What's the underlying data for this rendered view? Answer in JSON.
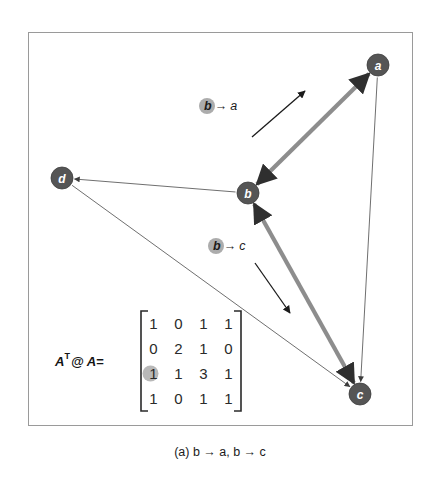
{
  "figure": {
    "caption": "(a) b → a, b → c",
    "frame_color": "#9a9a9a",
    "background": "#ffffff"
  },
  "graph": {
    "node_fill": "#555555",
    "node_text_color": "#ffffff",
    "thin_edge_color": "#5f5f5f",
    "thick_edge_color": "#8d8d8d",
    "nodes": [
      {
        "id": "a",
        "label": "a",
        "x": 378,
        "y": 65,
        "r": 11
      },
      {
        "id": "b",
        "label": "b",
        "x": 248,
        "y": 193,
        "r": 11
      },
      {
        "id": "c",
        "label": "c",
        "x": 360,
        "y": 394,
        "r": 11
      },
      {
        "id": "d",
        "label": "d",
        "x": 62,
        "y": 178,
        "r": 11
      }
    ],
    "edges": [
      {
        "from": "b",
        "to": "a",
        "style": "thick",
        "arrows": "both",
        "name": "edge-b-a"
      },
      {
        "from": "b",
        "to": "c",
        "style": "thick",
        "arrows": "both",
        "name": "edge-b-c"
      },
      {
        "from": "b",
        "to": "d",
        "style": "thin",
        "arrows": "to",
        "name": "edge-b-d"
      },
      {
        "from": "a",
        "to": "c",
        "style": "thin",
        "arrows": "to",
        "name": "edge-a-c"
      },
      {
        "from": "d",
        "to": "c",
        "style": "thin",
        "arrows": "to",
        "name": "edge-d-c"
      }
    ]
  },
  "annotations": [
    {
      "id": "annot-b-a",
      "source": "b",
      "arrow_glyph": "→",
      "target": "a",
      "text_x": 204,
      "text_y": 106,
      "badge_x": 207,
      "badge_y": 106,
      "badge_r": 8,
      "badge_color": "#a8a8a8",
      "arrow": {
        "x1": 252,
        "y1": 137,
        "x2": 305,
        "y2": 91
      }
    },
    {
      "id": "annot-b-c",
      "source": "b",
      "arrow_glyph": "→",
      "target": "c",
      "text_x": 213,
      "text_y": 246,
      "badge_x": 216,
      "badge_y": 246,
      "badge_r": 8,
      "badge_color": "#a8a8a8",
      "arrow": {
        "x1": 255,
        "y1": 263,
        "x2": 290,
        "y2": 313
      }
    }
  ],
  "matrix": {
    "label": "A",
    "label_sup": "T",
    "label_rest": "@ A=",
    "bracket_color": "#2a2a2a",
    "rows": [
      [
        "1",
        "0",
        "1",
        "1"
      ],
      [
        "0",
        "2",
        "1",
        "0"
      ],
      [
        "1",
        "1",
        "3",
        "1"
      ],
      [
        "1",
        "0",
        "1",
        "1"
      ]
    ],
    "highlight": {
      "row": 2,
      "col": 0,
      "color": "#b4b4b4",
      "r": 8
    },
    "origin": {
      "x": 141,
      "y": 311
    },
    "cell_w": 25,
    "cell_h": 25,
    "label_x": 55,
    "label_y": 361
  }
}
